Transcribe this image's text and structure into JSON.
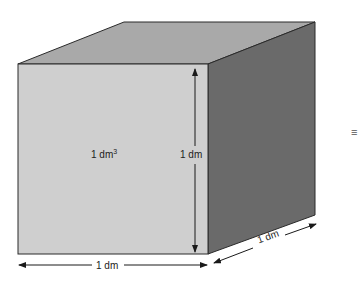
{
  "diagram": {
    "title": "",
    "shape": "cube",
    "labels": {
      "volume": "1 dm",
      "volume_exp": "3",
      "height": "1 dm",
      "width": "1 dm",
      "depth": "1 dm"
    },
    "side_symbol": "≡",
    "colors": {
      "front_face": "#cfcfcf",
      "top_face": "#a9a9a9",
      "right_face": "#6a6a6a",
      "edge": "#2a2a2a",
      "arrow": "#1a1a1a"
    }
  }
}
